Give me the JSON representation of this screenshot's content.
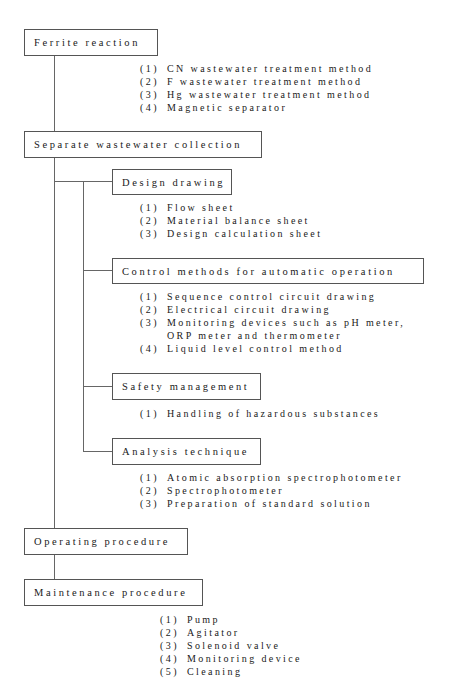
{
  "diagram": {
    "ferrite": {
      "title": "Ferrite reaction",
      "items": [
        {
          "n": "(1)",
          "text": "CN wastewater treatment method"
        },
        {
          "n": "(2)",
          "text": "F wastewater treatment method"
        },
        {
          "n": "(3)",
          "text": "Hg wastewater treatment method"
        },
        {
          "n": "(4)",
          "text": "Magnetic separator"
        }
      ]
    },
    "separate": {
      "title": "Separate wastewater collection"
    },
    "design": {
      "title": "Design drawing",
      "items": [
        {
          "n": "(1)",
          "text": "Flow sheet"
        },
        {
          "n": "(2)",
          "text": "Material balance sheet"
        },
        {
          "n": "(3)",
          "text": "Design calculation sheet"
        }
      ]
    },
    "control": {
      "title": "Control methods for automatic operation",
      "items": [
        {
          "n": "(1)",
          "text": "Sequence control circuit drawing"
        },
        {
          "n": "(2)",
          "text": "Electrical circuit drawing"
        },
        {
          "n": "(3)",
          "text": "Monitoring devices such as pH meter,"
        },
        {
          "n": "",
          "text": "ORP meter and thermometer"
        },
        {
          "n": "(4)",
          "text": "Liquid level control method"
        }
      ]
    },
    "safety": {
      "title": "Safety management",
      "items": [
        {
          "n": "(1)",
          "text": "Handling of hazardous substances"
        }
      ]
    },
    "analysis": {
      "title": "Analysis technique",
      "items": [
        {
          "n": "(1)",
          "text": "Atomic absorption spectrophotometer"
        },
        {
          "n": "(2)",
          "text": "Spectrophotometer"
        },
        {
          "n": "(3)",
          "text": "Preparation of standard solution"
        }
      ]
    },
    "operating": {
      "title": "Operating procedure"
    },
    "maintenance": {
      "title": "Maintenance procedure",
      "items": [
        {
          "n": "(1)",
          "text": "Pump"
        },
        {
          "n": "(2)",
          "text": "Agitator"
        },
        {
          "n": "(3)",
          "text": "Solenoid valve"
        },
        {
          "n": "(4)",
          "text": "Monitoring device"
        },
        {
          "n": "(5)",
          "text": "Cleaning"
        }
      ]
    }
  }
}
